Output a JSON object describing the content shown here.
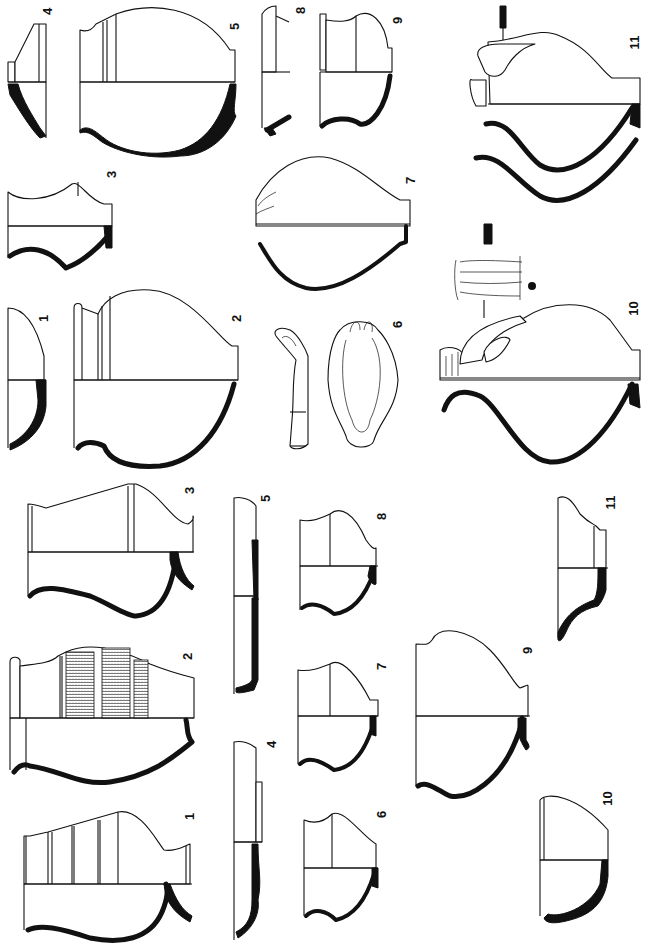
{
  "plate": {
    "orientation": "rotated 90 degrees counter-clockwise",
    "background": "#ffffff",
    "ink_color": "#111111"
  },
  "group_upper": {
    "figures": [
      {
        "label": "1",
        "type": "bowl profile"
      },
      {
        "label": "2",
        "type": "jar profile"
      },
      {
        "label": "3",
        "type": "beaker profile"
      },
      {
        "label": "4",
        "type": "lid/dish profile"
      },
      {
        "label": "5",
        "type": "globular jar profile"
      },
      {
        "label": "6",
        "type": "handle fragment views"
      },
      {
        "label": "7",
        "type": "jar profile"
      },
      {
        "label": "8",
        "type": "rim fragment profile"
      },
      {
        "label": "9",
        "type": "jar profile"
      },
      {
        "label": "10",
        "type": "jug with handle profile"
      },
      {
        "label": "11",
        "type": "jug with handle profile"
      }
    ]
  },
  "group_lower": {
    "figures": [
      {
        "label": "1",
        "type": "beaker with grooves"
      },
      {
        "label": "2",
        "type": "beaker with hatched bands"
      },
      {
        "label": "3",
        "type": "beaker profile"
      },
      {
        "label": "4",
        "type": "plate profile"
      },
      {
        "label": "5",
        "type": "plate profile"
      },
      {
        "label": "6",
        "type": "small cup profile"
      },
      {
        "label": "7",
        "type": "small cup profile"
      },
      {
        "label": "8",
        "type": "small cup profile"
      },
      {
        "label": "9",
        "type": "bowl profile"
      },
      {
        "label": "10",
        "type": "bowl profile"
      },
      {
        "label": "11",
        "type": "dish profile"
      }
    ]
  }
}
